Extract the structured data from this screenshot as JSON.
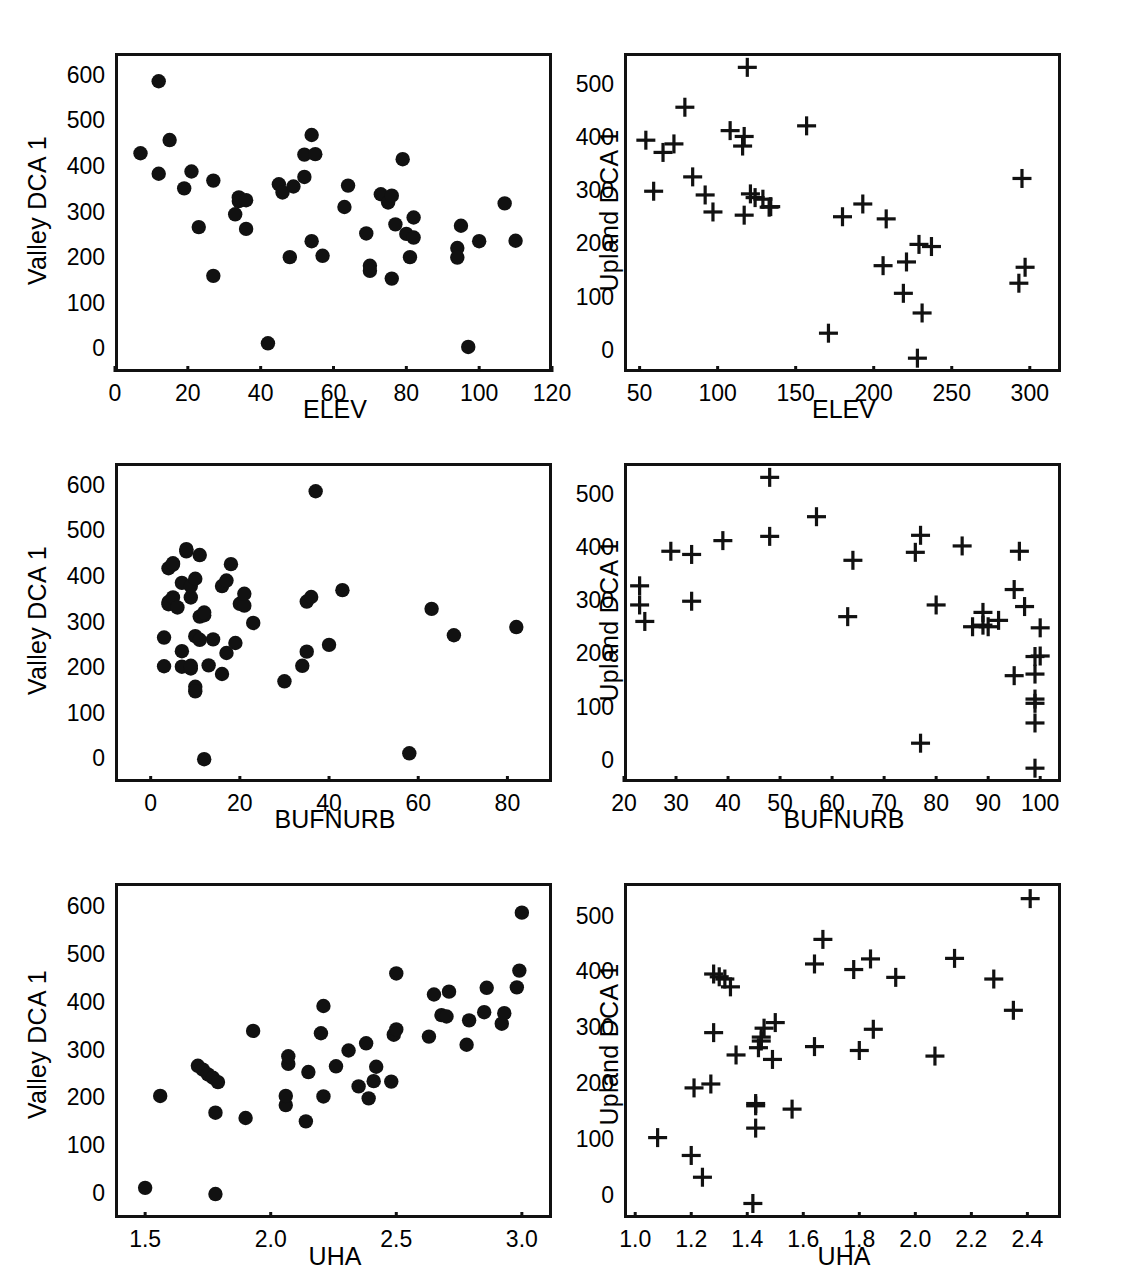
{
  "figure": {
    "panel_count": 6,
    "marker_valley": "filled-circle",
    "marker_upland": "plus-cross",
    "ink_color": "#111111",
    "background": "#ffffff"
  },
  "chart_data": [
    {
      "type": "scatter",
      "panel": "A",
      "title": "A",
      "xlabel": "ELEV",
      "ylabel": "Valley DCA 1",
      "xlim": [
        0,
        120
      ],
      "ylim": [
        650,
        -50
      ],
      "y_inverted": true,
      "xticks": [
        0,
        20,
        40,
        60,
        80,
        100,
        120
      ],
      "yticks": [
        0,
        100,
        200,
        300,
        400,
        500,
        600
      ],
      "grid": false,
      "legend": "none",
      "marker": "circle",
      "points": [
        [
          7,
          430
        ],
        [
          12,
          588
        ],
        [
          12,
          385
        ],
        [
          15,
          459
        ],
        [
          19,
          353
        ],
        [
          21,
          390
        ],
        [
          23,
          268
        ],
        [
          27,
          370
        ],
        [
          27,
          161
        ],
        [
          33,
          296
        ],
        [
          34,
          333
        ],
        [
          34,
          325
        ],
        [
          36,
          264
        ],
        [
          36,
          327
        ],
        [
          42,
          13
        ],
        [
          45,
          362
        ],
        [
          46,
          344
        ],
        [
          48,
          202
        ],
        [
          49,
          357
        ],
        [
          52,
          378
        ],
        [
          52,
          427
        ],
        [
          54,
          237
        ],
        [
          54,
          470
        ],
        [
          55,
          428
        ],
        [
          57,
          205
        ],
        [
          63,
          312
        ],
        [
          64,
          359
        ],
        [
          69,
          254
        ],
        [
          70,
          183
        ],
        [
          70,
          172
        ],
        [
          73,
          340
        ],
        [
          75,
          322
        ],
        [
          76,
          155
        ],
        [
          76,
          337
        ],
        [
          77,
          274
        ],
        [
          79,
          417
        ],
        [
          80,
          253
        ],
        [
          81,
          202
        ],
        [
          82,
          289
        ],
        [
          82,
          245
        ],
        [
          94,
          222
        ],
        [
          94,
          201
        ],
        [
          95,
          271
        ],
        [
          97,
          5
        ],
        [
          100,
          237
        ],
        [
          107,
          320
        ],
        [
          110,
          238
        ]
      ]
    },
    {
      "type": "scatter",
      "panel": "B",
      "title": "B",
      "xlabel": "ELEV",
      "ylabel": "Upland DCA 1",
      "xlim": [
        40,
        320
      ],
      "ylim": [
        560,
        -40
      ],
      "y_inverted": true,
      "xticks": [
        50,
        100,
        150,
        200,
        250,
        300
      ],
      "yticks": [
        0,
        100,
        200,
        300,
        400,
        500
      ],
      "grid": false,
      "legend": "none",
      "marker": "plus",
      "points": [
        [
          54,
          396
        ],
        [
          59,
          300
        ],
        [
          65,
          373
        ],
        [
          72,
          389
        ],
        [
          79,
          458
        ],
        [
          84,
          327
        ],
        [
          92,
          293
        ],
        [
          97,
          261
        ],
        [
          108,
          414
        ],
        [
          116,
          385
        ],
        [
          117,
          403
        ],
        [
          119,
          533
        ],
        [
          121,
          295
        ],
        [
          124,
          288
        ],
        [
          117,
          255
        ],
        [
          129,
          285
        ],
        [
          133,
          270
        ],
        [
          134,
          271
        ],
        [
          157,
          423
        ],
        [
          171,
          33
        ],
        [
          180,
          252
        ],
        [
          193,
          276
        ],
        [
          206,
          160
        ],
        [
          208,
          248
        ],
        [
          219,
          108
        ],
        [
          221,
          167
        ],
        [
          229,
          200
        ],
        [
          231,
          71
        ],
        [
          228,
          -14
        ],
        [
          237,
          196
        ],
        [
          293,
          127
        ],
        [
          297,
          157
        ],
        [
          295,
          324
        ]
      ]
    },
    {
      "type": "scatter",
      "panel": "C",
      "title": "C",
      "xlabel": "BUFNURB",
      "ylabel": "Valley DCA 1",
      "xlim": [
        -8,
        90
      ],
      "ylim": [
        650,
        -50
      ],
      "y_inverted": true,
      "xticks": [
        0,
        20,
        40,
        60,
        80
      ],
      "yticks": [
        0,
        100,
        200,
        300,
        400,
        500,
        600
      ],
      "grid": false,
      "legend": "none",
      "marker": "circle",
      "points": [
        [
          3,
          204
        ],
        [
          3,
          267
        ],
        [
          4,
          345
        ],
        [
          4,
          340
        ],
        [
          4,
          419
        ],
        [
          5,
          355
        ],
        [
          5,
          427
        ],
        [
          5,
          430
        ],
        [
          6,
          333
        ],
        [
          7,
          203
        ],
        [
          7,
          237
        ],
        [
          7,
          387
        ],
        [
          8,
          456
        ],
        [
          8,
          461
        ],
        [
          9,
          199
        ],
        [
          9,
          355
        ],
        [
          9,
          380
        ],
        [
          9,
          205
        ],
        [
          10,
          159
        ],
        [
          10,
          149
        ],
        [
          10,
          270
        ],
        [
          10,
          396
        ],
        [
          11,
          262
        ],
        [
          11,
          313
        ],
        [
          11,
          448
        ],
        [
          12,
          0
        ],
        [
          12,
          316
        ],
        [
          12,
          322
        ],
        [
          13,
          206
        ],
        [
          14,
          263
        ],
        [
          16,
          187
        ],
        [
          16,
          380
        ],
        [
          17,
          233
        ],
        [
          17,
          392
        ],
        [
          18,
          428
        ],
        [
          19,
          255
        ],
        [
          20,
          341
        ],
        [
          21,
          337
        ],
        [
          21,
          363
        ],
        [
          23,
          299
        ],
        [
          30,
          171
        ],
        [
          34,
          205
        ],
        [
          35,
          236
        ],
        [
          35,
          346
        ],
        [
          36,
          356
        ],
        [
          37,
          588
        ],
        [
          40,
          251
        ],
        [
          43,
          371
        ],
        [
          58,
          13
        ],
        [
          63,
          330
        ],
        [
          68,
          272
        ],
        [
          82,
          290
        ]
      ]
    },
    {
      "type": "scatter",
      "panel": "D",
      "title": "D",
      "xlabel": "BUFNURB",
      "ylabel": "Upland DCA 1",
      "xlim": [
        20,
        104
      ],
      "ylim": [
        560,
        -40
      ],
      "y_inverted": true,
      "xticks": [
        20,
        30,
        40,
        50,
        60,
        70,
        80,
        90,
        100
      ],
      "yticks": [
        0,
        100,
        200,
        300,
        400,
        500
      ],
      "grid": false,
      "legend": "none",
      "marker": "plus",
      "points": [
        [
          23,
          293
        ],
        [
          23,
          329
        ],
        [
          24,
          262
        ],
        [
          29,
          394
        ],
        [
          33,
          300
        ],
        [
          33,
          388
        ],
        [
          39,
          414
        ],
        [
          48,
          422
        ],
        [
          48,
          533
        ],
        [
          57,
          459
        ],
        [
          63,
          271
        ],
        [
          64,
          377
        ],
        [
          76,
          392
        ],
        [
          77,
          424
        ],
        [
          77,
          33
        ],
        [
          80,
          293
        ],
        [
          85,
          404
        ],
        [
          87,
          252
        ],
        [
          89,
          255
        ],
        [
          89,
          279
        ],
        [
          90,
          252
        ],
        [
          92,
          264
        ],
        [
          95,
          160
        ],
        [
          95,
          322
        ],
        [
          96,
          394
        ],
        [
          97,
          290
        ],
        [
          99,
          -14
        ],
        [
          99,
          71
        ],
        [
          99,
          108
        ],
        [
          99,
          116
        ],
        [
          99,
          163
        ],
        [
          99,
          196
        ],
        [
          100,
          197
        ],
        [
          100,
          250
        ]
      ]
    },
    {
      "type": "scatter",
      "panel": "E",
      "title": "E",
      "xlabel": "UHA",
      "ylabel": "Valley DCA 1",
      "xlim": [
        1.38,
        3.12
      ],
      "ylim": [
        650,
        -50
      ],
      "y_inverted": true,
      "xticks": [
        1.5,
        2.0,
        2.5,
        3.0
      ],
      "xtick_labels": [
        "1.5",
        "2.0",
        "2.5",
        "3.0"
      ],
      "yticks": [
        0,
        100,
        200,
        300,
        400,
        500,
        600
      ],
      "grid": false,
      "legend": "none",
      "marker": "circle",
      "points": [
        [
          1.5,
          13
        ],
        [
          1.56,
          205
        ],
        [
          1.71,
          268
        ],
        [
          1.73,
          260
        ],
        [
          1.75,
          250
        ],
        [
          1.77,
          243
        ],
        [
          1.78,
          0
        ],
        [
          1.78,
          170
        ],
        [
          1.79,
          234
        ],
        [
          1.9,
          159
        ],
        [
          1.93,
          341
        ],
        [
          2.06,
          186
        ],
        [
          2.06,
          205
        ],
        [
          2.07,
          272
        ],
        [
          2.07,
          288
        ],
        [
          2.14,
          152
        ],
        [
          2.15,
          255
        ],
        [
          2.2,
          336
        ],
        [
          2.21,
          204
        ],
        [
          2.21,
          393
        ],
        [
          2.26,
          267
        ],
        [
          2.31,
          300
        ],
        [
          2.35,
          225
        ],
        [
          2.38,
          315
        ],
        [
          2.39,
          200
        ],
        [
          2.41,
          236
        ],
        [
          2.42,
          266
        ],
        [
          2.48,
          235
        ],
        [
          2.49,
          333
        ],
        [
          2.5,
          344
        ],
        [
          2.5,
          461
        ],
        [
          2.63,
          329
        ],
        [
          2.65,
          417
        ],
        [
          2.68,
          374
        ],
        [
          2.7,
          371
        ],
        [
          2.71,
          423
        ],
        [
          2.78,
          312
        ],
        [
          2.79,
          363
        ],
        [
          2.85,
          380
        ],
        [
          2.86,
          431
        ],
        [
          2.92,
          356
        ],
        [
          2.93,
          378
        ],
        [
          2.98,
          432
        ],
        [
          2.99,
          467
        ],
        [
          3.0,
          588
        ]
      ]
    },
    {
      "type": "scatter",
      "panel": "F",
      "title": "F",
      "xlabel": "UHA",
      "ylabel": "Upland DCA 1",
      "xlim": [
        0.96,
        2.52
      ],
      "ylim": [
        560,
        -40
      ],
      "y_inverted": true,
      "xticks": [
        1.0,
        1.2,
        1.4,
        1.6,
        1.8,
        2.0,
        2.2,
        2.4
      ],
      "xtick_labels": [
        "1.0",
        "1.2",
        "1.4",
        "1.6",
        "1.8",
        "2.0",
        "2.2",
        "2.4"
      ],
      "yticks": [
        0,
        100,
        200,
        300,
        400,
        500
      ],
      "grid": false,
      "legend": "none",
      "marker": "plus",
      "points": [
        [
          1.08,
          104
        ],
        [
          1.2,
          72
        ],
        [
          1.21,
          193
        ],
        [
          1.24,
          33
        ],
        [
          1.27,
          200
        ],
        [
          1.28,
          292
        ],
        [
          1.28,
          397
        ],
        [
          1.3,
          392
        ],
        [
          1.32,
          388
        ],
        [
          1.34,
          374
        ],
        [
          1.36,
          252
        ],
        [
          1.42,
          -14
        ],
        [
          1.43,
          121
        ],
        [
          1.43,
          161
        ],
        [
          1.43,
          165
        ],
        [
          1.44,
          265
        ],
        [
          1.45,
          277
        ],
        [
          1.45,
          284
        ],
        [
          1.46,
          300
        ],
        [
          1.49,
          244
        ],
        [
          1.5,
          310
        ],
        [
          1.56,
          155
        ],
        [
          1.64,
          267
        ],
        [
          1.64,
          415
        ],
        [
          1.67,
          459
        ],
        [
          1.78,
          405
        ],
        [
          1.8,
          260
        ],
        [
          1.84,
          424
        ],
        [
          1.85,
          298
        ],
        [
          1.93,
          391
        ],
        [
          2.07,
          250
        ],
        [
          2.14,
          425
        ],
        [
          2.28,
          388
        ],
        [
          2.35,
          332
        ],
        [
          2.41,
          532
        ]
      ]
    }
  ]
}
